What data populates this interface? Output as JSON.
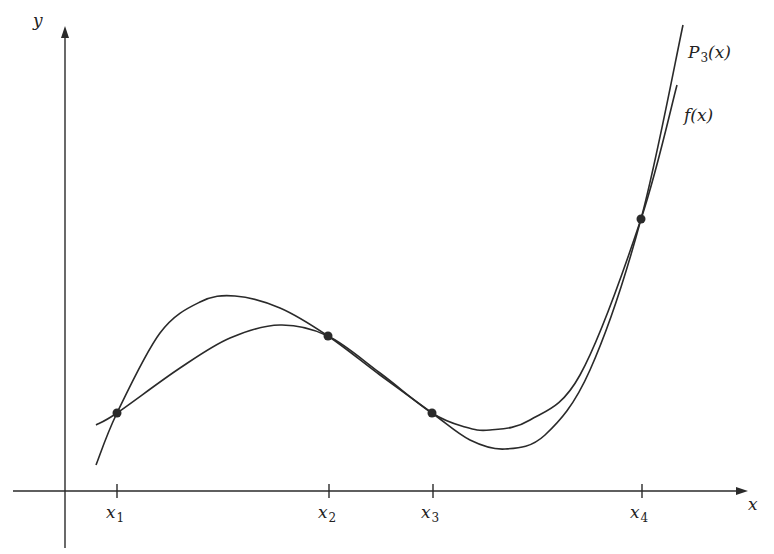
{
  "chart_data": {
    "type": "line",
    "title": "",
    "xlabel": "x",
    "ylabel": "y",
    "grid": false,
    "tick_labels": [
      "x1",
      "x2",
      "x3",
      "x4"
    ],
    "series": [
      {
        "name": "P3(x)",
        "description": "cubic interpolating polynomial",
        "pixel_points": [
          [
            96,
            465
          ],
          [
            117,
            413
          ],
          [
            160,
            333
          ],
          [
            200,
            302
          ],
          [
            235,
            296
          ],
          [
            280,
            308
          ],
          [
            328,
            336
          ],
          [
            380,
            375
          ],
          [
            432,
            413
          ],
          [
            470,
            440
          ],
          [
            505,
            449
          ],
          [
            545,
            435
          ],
          [
            590,
            370
          ],
          [
            641,
            219
          ],
          [
            683,
            25
          ]
        ]
      },
      {
        "name": "f(x)",
        "description": "interpolated function",
        "pixel_points": [
          [
            96,
            425
          ],
          [
            117,
            413
          ],
          [
            180,
            368
          ],
          [
            230,
            338
          ],
          [
            280,
            325
          ],
          [
            328,
            336
          ],
          [
            380,
            373
          ],
          [
            432,
            413
          ],
          [
            465,
            427
          ],
          [
            490,
            430
          ],
          [
            530,
            420
          ],
          [
            580,
            375
          ],
          [
            641,
            219
          ],
          [
            677,
            85
          ]
        ]
      }
    ],
    "interpolation_nodes": [
      {
        "label": "x1",
        "px": [
          117,
          413
        ]
      },
      {
        "label": "x2",
        "px": [
          328,
          336
        ]
      },
      {
        "label": "x3",
        "px": [
          432,
          413
        ]
      },
      {
        "label": "x4",
        "px": [
          641,
          219
        ]
      }
    ]
  },
  "labels": {
    "y_axis": "y",
    "x_axis": "x",
    "p3_name": "P",
    "p3_sub": "3",
    "p3_arg": "(x)",
    "f_label": "f(x)",
    "ticks": [
      {
        "main": "x",
        "sub": "1"
      },
      {
        "main": "x",
        "sub": "2"
      },
      {
        "main": "x",
        "sub": "3"
      },
      {
        "main": "x",
        "sub": "4"
      }
    ]
  },
  "colors": {
    "ink": "#2a2a2a",
    "background": "#ffffff"
  }
}
